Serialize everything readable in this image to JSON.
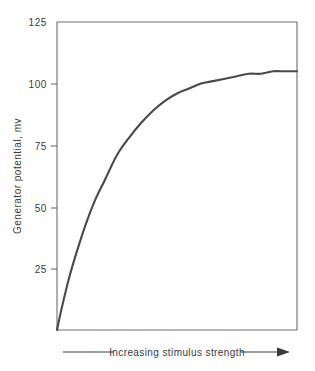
{
  "chart_data": {
    "type": "line",
    "title": "",
    "xlabel": "Increasing stimulus strength",
    "ylabel": "Generator potential, mv",
    "ylim": [
      0,
      125
    ],
    "xlim": [
      0,
      100
    ],
    "grid": false,
    "legend": null,
    "y_ticks": [
      125,
      100,
      75,
      50,
      25
    ],
    "y_tick_labels": [
      "125",
      "100",
      "75",
      "50",
      "25"
    ],
    "x_ticks": [],
    "x_tick_labels": [],
    "annotations": [
      {
        "name": "x-axis-direction-annotation",
        "text": "Increasing stimulus strength",
        "arrow": "right"
      }
    ],
    "series": [
      {
        "name": "generator potential",
        "color": "#494949",
        "x": [
          0,
          2,
          5,
          8,
          12,
          16,
          20,
          25,
          30,
          35,
          40,
          45,
          50,
          55,
          60,
          65,
          70,
          75,
          80,
          85,
          90,
          95,
          100
        ],
        "y": [
          0,
          9,
          21,
          31,
          43,
          53,
          61,
          71,
          78,
          84,
          89,
          93,
          96,
          98,
          100,
          101,
          102,
          103,
          104,
          104,
          105,
          105,
          105
        ]
      }
    ]
  },
  "axis": {
    "y_title": "Generator potential, mv",
    "x_annotation": "Increasing stimulus strength",
    "tick_125": "125",
    "tick_100": "100",
    "tick_75": "75",
    "tick_50": "50",
    "tick_25": "25"
  },
  "colors": {
    "background": "#ffffff",
    "frame": "#6e6e6e",
    "curve": "#494949",
    "text": "#3a3a3a"
  }
}
